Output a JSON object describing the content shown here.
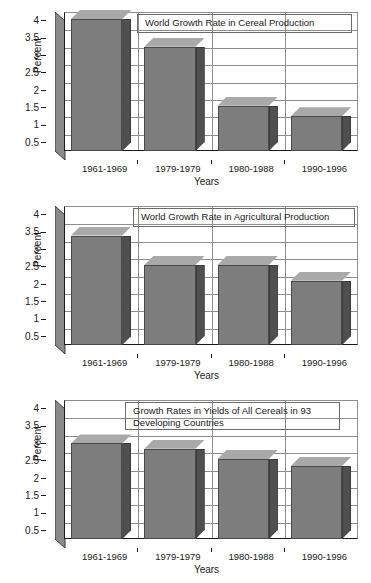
{
  "figure": {
    "axis_label_y": "Percent",
    "axis_label_x": "Years",
    "categories": [
      "1961-1969",
      "1979-1979",
      "1980-1988",
      "1990-1996"
    ],
    "yticks": [
      "0.5",
      "1",
      "1.5",
      "2",
      "2.5",
      "3",
      "3.5",
      "4"
    ],
    "colors": {
      "bar_front": "#7d7d7d",
      "bar_side": "#4f4f4f",
      "bar_top": "#a9a9a9",
      "gridline": "#8e8e8e",
      "axis": "#1a1a1a",
      "background": "#ffffff"
    }
  },
  "chart_data": [
    {
      "type": "bar",
      "title": "World Growth Rate in Cereal Production",
      "categories": [
        "1961-1969",
        "1979-1979",
        "1980-1988",
        "1990-1996"
      ],
      "values": [
        3.8,
        3.0,
        1.3,
        1.0
      ],
      "xlabel": "Years",
      "ylabel": "Percent",
      "ylim": [
        0,
        4
      ],
      "ytick_values": [
        0.5,
        1,
        1.5,
        2,
        2.5,
        3,
        3.5,
        4
      ],
      "grid": true,
      "legend": "none"
    },
    {
      "type": "bar",
      "title": "World Growth Rate in Agricultural Production",
      "categories": [
        "1961-1969",
        "1979-1979",
        "1980-1988",
        "1990-1996"
      ],
      "values": [
        3.15,
        2.3,
        2.3,
        1.85
      ],
      "xlabel": "Years",
      "ylabel": "Percent",
      "ylim": [
        0,
        4
      ],
      "ytick_values": [
        0.5,
        1,
        1.5,
        2,
        2.5,
        3,
        3.5,
        4
      ],
      "grid": true,
      "legend": "none"
    },
    {
      "type": "bar",
      "title": "Growth Rates in Yields of All Cereals in 93\nDeveloping Countries",
      "categories": [
        "1961-1969",
        "1979-1979",
        "1980-1988",
        "1990-1996"
      ],
      "values": [
        2.75,
        2.6,
        2.3,
        2.1
      ],
      "xlabel": "Years",
      "ylabel": "Percent",
      "ylim": [
        0,
        4
      ],
      "ytick_values": [
        0.5,
        1,
        1.5,
        2,
        2.5,
        3,
        3.5,
        4
      ],
      "grid": true,
      "legend": "none"
    }
  ]
}
